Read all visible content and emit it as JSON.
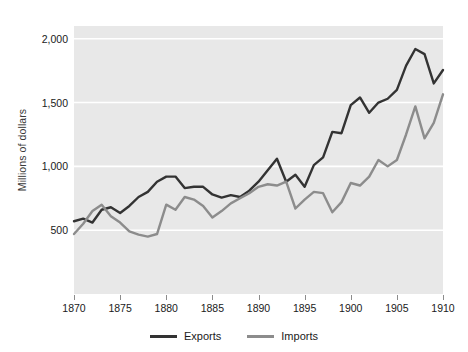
{
  "chart_data": {
    "type": "line",
    "title": "",
    "xlabel": "",
    "ylabel": "Millions of dollars",
    "xlim": [
      1870,
      1910
    ],
    "ylim": [
      0,
      2100
    ],
    "grid": true,
    "gridlines_y": [
      500,
      1000,
      1500,
      2000
    ],
    "legend_position": "bottom-center",
    "plot_bgcolor": "#e8e8e8",
    "x_tick_labels": [
      "1870",
      "1875",
      "1880",
      "1885",
      "1890",
      "1895",
      "1900",
      "1905",
      "1910"
    ],
    "x_ticks": [
      1870,
      1875,
      1880,
      1885,
      1890,
      1895,
      1900,
      1905,
      1910
    ],
    "y_tick_labels": [
      "500",
      "1,000",
      "1,500",
      "2,000"
    ],
    "y_ticks": [
      500,
      1000,
      1500,
      2000
    ],
    "x": [
      1870,
      1871,
      1872,
      1873,
      1874,
      1875,
      1876,
      1877,
      1878,
      1879,
      1880,
      1881,
      1882,
      1883,
      1884,
      1885,
      1886,
      1887,
      1888,
      1889,
      1890,
      1891,
      1892,
      1893,
      1894,
      1895,
      1896,
      1897,
      1898,
      1899,
      1900,
      1901,
      1902,
      1903,
      1904,
      1905,
      1906,
      1907,
      1908,
      1909,
      1910
    ],
    "series": [
      {
        "name": "Exports",
        "color": "#333333",
        "values": [
          570,
          590,
          560,
          660,
          680,
          635,
          690,
          760,
          800,
          880,
          920,
          920,
          830,
          840,
          840,
          780,
          755,
          775,
          760,
          810,
          880,
          970,
          1060,
          880,
          935,
          840,
          1010,
          1070,
          1270,
          1260,
          1480,
          1540,
          1420,
          1500,
          1530,
          1600,
          1790,
          1920,
          1880,
          1650,
          1755
        ]
      },
      {
        "name": "Imports",
        "color": "#8c8c8c",
        "values": [
          470,
          550,
          650,
          700,
          610,
          560,
          490,
          465,
          450,
          470,
          700,
          660,
          760,
          740,
          690,
          600,
          650,
          710,
          750,
          790,
          840,
          860,
          850,
          880,
          670,
          740,
          800,
          790,
          640,
          720,
          870,
          850,
          920,
          1050,
          1000,
          1050,
          1250,
          1470,
          1220,
          1340,
          1565
        ]
      }
    ]
  }
}
